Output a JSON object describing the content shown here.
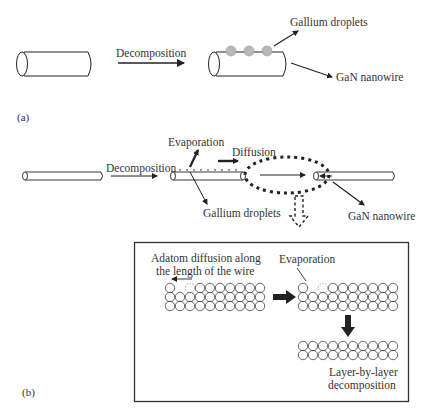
{
  "figure": {
    "panel_a": {
      "label": "(a)",
      "arrow_label": "Decomposition",
      "droplets_label": "Gallium droplets",
      "nanowire_label": "GaN nanowire",
      "droplet_count": 3
    },
    "panel_b": {
      "label": "(b)",
      "arrow_label": "Decomposition",
      "evaporation_label": "Evaporation",
      "diffusion_label": "Diffusion",
      "droplets_label": "Gallium droplets",
      "nanowire_label": "GaN nanowire",
      "inset": {
        "adatom_label_line1": "Adatom diffusion along",
        "adatom_label_line2": "the length of the wire",
        "evaporation_label": "Evaporation",
        "result_label_line1": "Layer-by-layer",
        "result_label_line2": "decomposition",
        "left_lattice": {
          "rows": 3,
          "cols": 10
        },
        "middle_lattice": {
          "rows": 3,
          "cols": 10
        },
        "bottom_lattice": {
          "rows": 2,
          "cols": 10
        }
      }
    },
    "colors": {
      "line": "#222222",
      "droplet": "#b8b8b8",
      "text": "#333333"
    }
  }
}
